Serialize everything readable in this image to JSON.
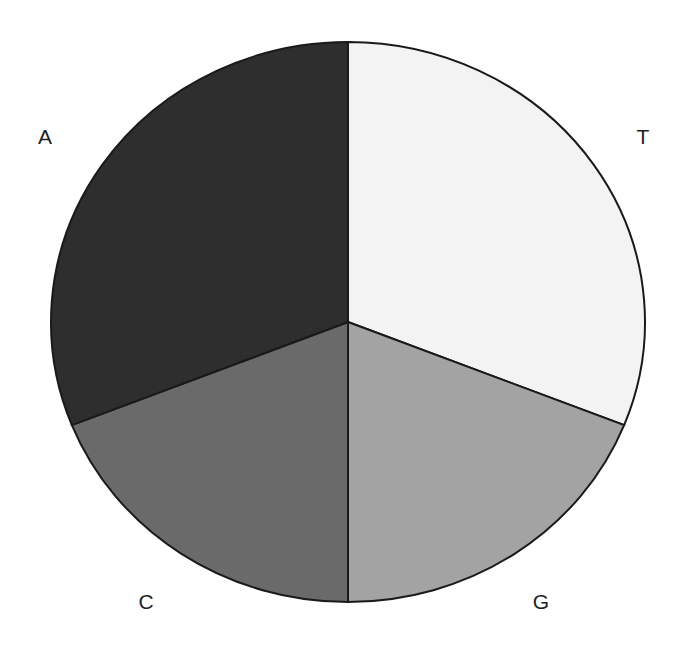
{
  "chart_data": {
    "type": "pie",
    "title": "",
    "categories": [
      "T",
      "G",
      "C",
      "A"
    ],
    "values": [
      31,
      19,
      19,
      31
    ],
    "colors": [
      "#f3f3f3",
      "#a3a3a3",
      "#6a6a6a",
      "#2e2e2e"
    ],
    "start_angle_deg": 0,
    "direction": "clockwise",
    "legend": "none",
    "labels": [
      {
        "text": "T",
        "x": 643,
        "y": 138
      },
      {
        "text": "G",
        "x": 541,
        "y": 603
      },
      {
        "text": "C",
        "x": 146,
        "y": 603
      },
      {
        "text": "A",
        "x": 45,
        "y": 138
      }
    ]
  },
  "geometry": {
    "cx": 348,
    "cy": 322,
    "rx": 297,
    "ry": 280
  }
}
